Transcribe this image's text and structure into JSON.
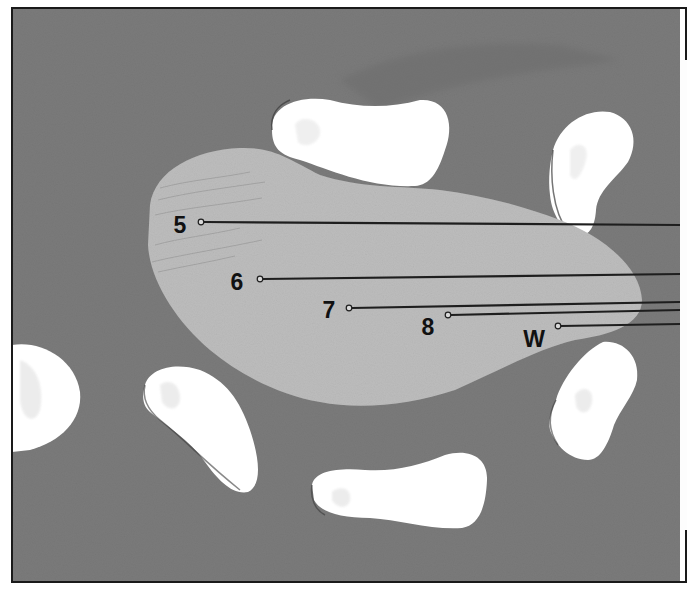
{
  "figure": {
    "kind": "labeled illustration",
    "frame": {
      "x": 12,
      "y": 8,
      "width": 674,
      "height": 574,
      "stroke": "#1a1a1a"
    },
    "colors": {
      "background_tissue": "#7b7b7b",
      "background_tissue_dark": "#6c6c6c",
      "central_body": "#bdbdbd",
      "central_body_edge": "#a9a9a9",
      "voids": "#ffffff",
      "void_tint": "#e6e6e6",
      "leader_line": "#1e1e1e",
      "label_text": "#111111",
      "right_margin": "#fdfdfd"
    }
  },
  "callouts": [
    {
      "id": "5",
      "label": "5",
      "label_x": 180,
      "label_y": 225,
      "dot_x": 201,
      "dot_y": 222,
      "end_x": 680,
      "end_y": 225
    },
    {
      "id": "6",
      "label": "6",
      "label_x": 237,
      "label_y": 282,
      "dot_x": 260,
      "dot_y": 279,
      "end_x": 680,
      "end_y": 274
    },
    {
      "id": "7",
      "label": "7",
      "label_x": 329,
      "label_y": 310,
      "dot_x": 349,
      "dot_y": 308,
      "end_x": 680,
      "end_y": 302
    },
    {
      "id": "8",
      "label": "8",
      "label_x": 428,
      "label_y": 327,
      "dot_x": 448,
      "dot_y": 315,
      "end_x": 680,
      "end_y": 310
    },
    {
      "id": "W",
      "label": "W",
      "label_x": 534,
      "label_y": 339,
      "dot_x": 558,
      "dot_y": 326,
      "end_x": 680,
      "end_y": 324
    }
  ]
}
